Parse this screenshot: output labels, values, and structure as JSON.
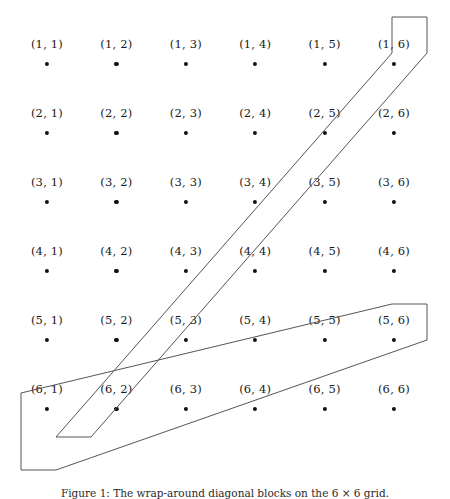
{
  "figure": {
    "caption": "Figure 1: The wrap-around diagonal blocks on the 6 × 6 grid.",
    "grid": {
      "rows": 6,
      "cols": 6,
      "origin_x": 47,
      "origin_y": 64,
      "step_x": 69.4,
      "step_y": 69.0,
      "label_offset_y": -14,
      "dot_color": "#111111",
      "label_color": "#1a1a1a",
      "nodes": [
        [
          {
            "label": "(1, 1)",
            "row": 1,
            "col": 1
          },
          {
            "label": "(1, 2)",
            "row": 1,
            "col": 2
          },
          {
            "label": "(1, 3)",
            "row": 1,
            "col": 3
          },
          {
            "label": "(1, 4)",
            "row": 1,
            "col": 4
          },
          {
            "label": "(1, 5)",
            "row": 1,
            "col": 5
          },
          {
            "label": "(1, 6)",
            "row": 1,
            "col": 6
          }
        ],
        [
          {
            "label": "(2, 1)",
            "row": 2,
            "col": 1
          },
          {
            "label": "(2, 2)",
            "row": 2,
            "col": 2
          },
          {
            "label": "(2, 3)",
            "row": 2,
            "col": 3
          },
          {
            "label": "(2, 4)",
            "row": 2,
            "col": 4
          },
          {
            "label": "(2, 5)",
            "row": 2,
            "col": 5
          },
          {
            "label": "(2, 6)",
            "row": 2,
            "col": 6
          }
        ],
        [
          {
            "label": "(3, 1)",
            "row": 3,
            "col": 1
          },
          {
            "label": "(3, 2)",
            "row": 3,
            "col": 2
          },
          {
            "label": "(3, 3)",
            "row": 3,
            "col": 3
          },
          {
            "label": "(3, 4)",
            "row": 3,
            "col": 4
          },
          {
            "label": "(3, 5)",
            "row": 3,
            "col": 5
          },
          {
            "label": "(3, 6)",
            "row": 3,
            "col": 6
          }
        ],
        [
          {
            "label": "(4, 1)",
            "row": 4,
            "col": 1
          },
          {
            "label": "(4, 2)",
            "row": 4,
            "col": 2
          },
          {
            "label": "(4, 3)",
            "row": 4,
            "col": 3
          },
          {
            "label": "(4, 4)",
            "row": 4,
            "col": 4
          },
          {
            "label": "(4, 5)",
            "row": 4,
            "col": 5
          },
          {
            "label": "(4, 6)",
            "row": 4,
            "col": 6
          }
        ],
        [
          {
            "label": "(5, 1)",
            "row": 5,
            "col": 1
          },
          {
            "label": "(5, 2)",
            "row": 5,
            "col": 2
          },
          {
            "label": "(5, 3)",
            "row": 5,
            "col": 3
          },
          {
            "label": "(5, 4)",
            "row": 5,
            "col": 4
          },
          {
            "label": "(5, 5)",
            "row": 5,
            "col": 5
          },
          {
            "label": "(5, 6)",
            "row": 5,
            "col": 6
          }
        ],
        [
          {
            "label": "(6, 1)",
            "row": 6,
            "col": 1
          },
          {
            "label": "(6, 2)",
            "row": 6,
            "col": 2
          },
          {
            "label": "(6, 3)",
            "row": 6,
            "col": 3
          },
          {
            "label": "(6, 4)",
            "row": 6,
            "col": 4
          },
          {
            "label": "(6, 5)",
            "row": 6,
            "col": 5
          },
          {
            "label": "(6, 6)",
            "row": 6,
            "col": 6
          }
        ]
      ]
    },
    "bands": {
      "stroke_color": "#555555",
      "stroke_width": 1,
      "fill": "none",
      "shapes": [
        {
          "name": "upper-diagonal-band",
          "points": "392,17 427,17 427,53 56,437 265,437 265,437"
        },
        {
          "name": "lower-diagonal-band",
          "points": "392,304 427,304 427,340 300,470 21,470 21,393"
        }
      ],
      "outlines": [
        {
          "name": "band-outline-upper",
          "path": "M 392,17 L 427,17 L 427,53 L 91,437 L 56,437 L 392,53 Z"
        },
        {
          "name": "band-outline-lower",
          "path": "M 392,304 L 427,304 L 427,340 L 56,470 L 21,470 L 21,393 Z"
        }
      ]
    }
  }
}
